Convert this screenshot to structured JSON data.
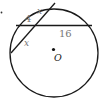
{
  "diagram": {
    "type": "circle-intersecting-chords",
    "center_label": "O",
    "labels": {
      "segment_a": "4",
      "segment_b": "x",
      "segment_c": "x",
      "segment_d": "16"
    },
    "colors": {
      "stroke": "#1a1a1a",
      "label": "#777777"
    }
  }
}
